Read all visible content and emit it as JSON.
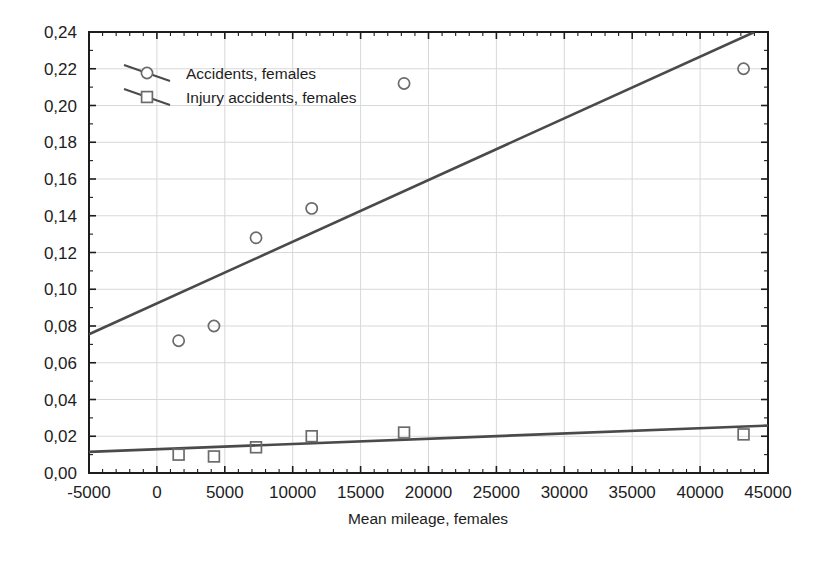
{
  "chart_data": {
    "type": "scatter",
    "title": "",
    "xlabel": "Mean mileage, females",
    "ylabel": "",
    "xlim": [
      -5000,
      45000
    ],
    "ylim": [
      0.0,
      0.24
    ],
    "xticks": [
      "-5000",
      "0",
      "5000",
      "10000",
      "15000",
      "20000",
      "25000",
      "30000",
      "35000",
      "40000",
      "45000"
    ],
    "xtick_values": [
      -5000,
      0,
      5000,
      10000,
      15000,
      20000,
      25000,
      30000,
      35000,
      40000,
      45000
    ],
    "yticks": [
      "0,00",
      "0,02",
      "0,04",
      "0,06",
      "0,08",
      "0,10",
      "0,12",
      "0,14",
      "0,16",
      "0,18",
      "0,20",
      "0,22",
      "0,24"
    ],
    "ytick_values": [
      0.0,
      0.02,
      0.04,
      0.06,
      0.08,
      0.1,
      0.12,
      0.14,
      0.16,
      0.18,
      0.2,
      0.22,
      0.24
    ],
    "grid": true,
    "legend_position": "top-left",
    "decimal_separator": ",",
    "series": [
      {
        "name": "Accidents, females",
        "marker": "circle",
        "color": "#555555",
        "x": [
          1600,
          4200,
          7300,
          11400,
          18200,
          43200
        ],
        "values": [
          0.072,
          0.08,
          0.128,
          0.144,
          0.212,
          0.22
        ],
        "trendline": {
          "x": [
            -5000,
            44000
          ],
          "y": [
            0.0755,
            0.24
          ]
        }
      },
      {
        "name": "Injury accidents, females",
        "marker": "square",
        "color": "#555555",
        "x": [
          1600,
          4200,
          7300,
          11400,
          18200,
          43200
        ],
        "values": [
          0.01,
          0.009,
          0.014,
          0.02,
          0.022,
          0.021
        ],
        "trendline": {
          "x": [
            -5000,
            45000
          ],
          "y": [
            0.0115,
            0.0258
          ]
        }
      }
    ]
  },
  "legend": {
    "entries": [
      {
        "label": "Accidents, females",
        "marker": "circle"
      },
      {
        "label": "Injury accidents, females",
        "marker": "square"
      }
    ]
  },
  "axis": {
    "x_title": "Mean mileage, females"
  },
  "colors": {
    "axis": "#1d1d1d",
    "grid": "#d8d8d8",
    "marker": "#6b6b6b",
    "trend": "#4a4a4a",
    "background": "#ffffff"
  }
}
